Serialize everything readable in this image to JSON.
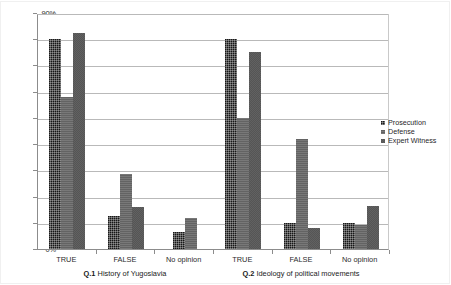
{
  "chart_data": {
    "type": "bar",
    "title": "",
    "subtitle": "",
    "xlabel": "",
    "ylabel": "",
    "ylim": [
      0,
      90
    ],
    "ytick_labels": [
      "0%",
      "10%",
      "20%",
      "30%",
      "40%",
      "50%",
      "60%",
      "70%",
      "80%",
      "90%"
    ],
    "ytick_values": [
      0,
      10,
      20,
      30,
      40,
      50,
      60,
      70,
      80,
      90
    ],
    "grid": true,
    "legend_position": "right",
    "categories": [
      "TRUE",
      "FALSE",
      "No opinion",
      "TRUE",
      "FALSE",
      "No opinion"
    ],
    "group_labels": [
      {
        "prefix": "Q.1",
        "text": "History of Yugoslavia"
      },
      {
        "prefix": "Q.2",
        "text": "Ideology of political movements"
      }
    ],
    "series": [
      {
        "name": "Prosecution",
        "color": "#171717",
        "values": [
          80,
          12.5,
          6.5,
          80,
          10,
          10
        ]
      },
      {
        "name": "Defense",
        "color": "#696969",
        "values": [
          58,
          28.5,
          12,
          50,
          42,
          9
        ]
      },
      {
        "name": "Expert Witness",
        "color": "#2a2a2a",
        "values": [
          82.5,
          16,
          0,
          75,
          8,
          16.5
        ]
      }
    ]
  },
  "legend": {
    "items": [
      {
        "label": "Prosecution"
      },
      {
        "label": "Defense"
      },
      {
        "label": "Expert Witness"
      }
    ]
  }
}
